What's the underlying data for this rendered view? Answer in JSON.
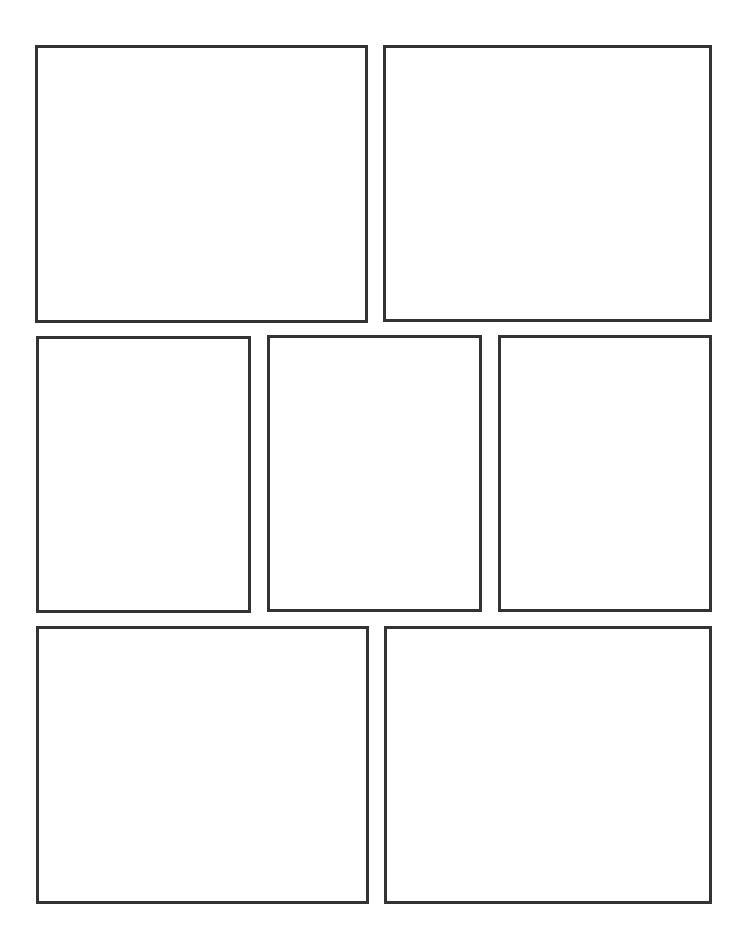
{
  "page": {
    "type": "comic-panel-template",
    "background": "#ffffff",
    "border_color": "#333333",
    "border_width": 3,
    "rows": [
      {
        "name": "top-row",
        "panels": [
          {
            "id": "panel-1",
            "x": 35,
            "y": 45,
            "w": 333,
            "h": 278
          },
          {
            "id": "panel-2",
            "x": 383,
            "y": 45,
            "w": 329,
            "h": 277
          }
        ]
      },
      {
        "name": "middle-row",
        "panels": [
          {
            "id": "panel-3",
            "x": 36,
            "y": 336,
            "w": 215,
            "h": 277
          },
          {
            "id": "panel-4",
            "x": 267,
            "y": 335,
            "w": 215,
            "h": 277
          },
          {
            "id": "panel-5",
            "x": 498,
            "y": 335,
            "w": 214,
            "h": 277
          }
        ]
      },
      {
        "name": "bottom-row",
        "panels": [
          {
            "id": "panel-6",
            "x": 36,
            "y": 626,
            "w": 333,
            "h": 278
          },
          {
            "id": "panel-7",
            "x": 384,
            "y": 626,
            "w": 328,
            "h": 278
          }
        ]
      }
    ]
  }
}
